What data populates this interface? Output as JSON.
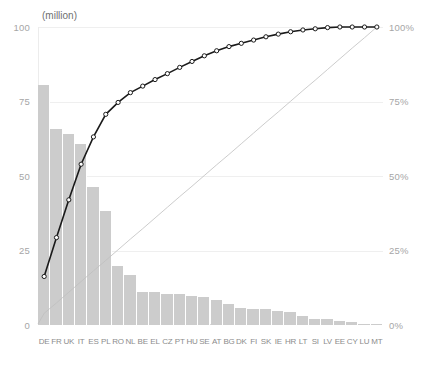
{
  "axes": {
    "unit_title": "(million)",
    "left_ticks": [
      "100",
      "75",
      "50",
      "25",
      "0"
    ],
    "right_ticks": [
      "100%",
      "75%",
      "50%",
      "25%",
      "0%"
    ]
  },
  "colors": {
    "bar": "#cccccc",
    "cumulative_line": "#1a1a1a",
    "marker_fill": "#ffffff",
    "reference_line": "#bfbfbf",
    "grid": "#efefef",
    "tick_text": "#a6a6a6",
    "xtick_text": "#8c8c8c"
  },
  "chart_data": {
    "type": "bar",
    "title": "",
    "subtitle": "",
    "xlabel": "",
    "ylabel": "(million)",
    "ylim": [
      0,
      100
    ],
    "y2lim": [
      0,
      100
    ],
    "grid": true,
    "legend": "none",
    "categories": [
      "DE",
      "FR",
      "UK",
      "IT",
      "ES",
      "PL",
      "RO",
      "NL",
      "BE",
      "EL",
      "CZ",
      "PT",
      "HU",
      "SE",
      "AT",
      "BG",
      "DK",
      "FI",
      "SK",
      "IE",
      "HR",
      "LT",
      "SI",
      "LV",
      "EE",
      "CY",
      "LU",
      "MT"
    ],
    "series": [
      {
        "name": "Population",
        "type": "bar",
        "axis": "left",
        "unit": "million",
        "values": [
          80.8,
          65.9,
          64.3,
          60.8,
          46.5,
          38.5,
          20.0,
          16.8,
          11.2,
          11.0,
          10.5,
          10.5,
          9.9,
          9.6,
          8.5,
          7.2,
          5.6,
          5.5,
          5.4,
          4.6,
          4.3,
          2.9,
          2.1,
          2.0,
          1.3,
          0.9,
          0.5,
          0.4
        ]
      },
      {
        "name": "Cumulative %",
        "type": "line",
        "axis": "right",
        "unit": "%",
        "values": [
          16.0,
          29.1,
          41.8,
          53.8,
          63.0,
          70.6,
          74.6,
          77.9,
          80.1,
          82.3,
          84.3,
          86.4,
          88.4,
          90.3,
          92.0,
          93.4,
          94.5,
          95.6,
          96.7,
          97.6,
          98.4,
          99.0,
          99.4,
          99.8,
          100.0,
          100.0,
          100.0,
          100.0
        ]
      },
      {
        "name": "Uniform reference",
        "type": "line",
        "axis": "right",
        "unit": "%",
        "values": [
          3.6,
          7.1,
          10.7,
          14.3,
          17.9,
          21.4,
          25.0,
          28.6,
          32.1,
          35.7,
          39.3,
          42.9,
          46.4,
          50.0,
          53.6,
          57.1,
          60.7,
          64.3,
          67.9,
          71.4,
          75.0,
          78.6,
          82.1,
          85.7,
          89.3,
          92.9,
          96.4,
          100.0
        ]
      }
    ]
  }
}
